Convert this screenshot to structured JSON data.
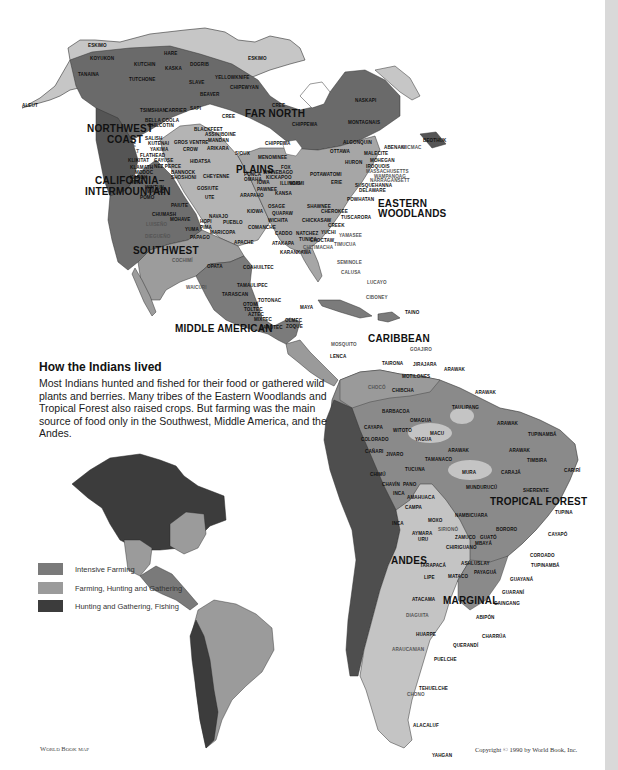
{
  "caption": {
    "title": "How the Indians lived",
    "body": "Most Indians hunted and fished for their food or gathered wild plants and berries. Many tribes of the Eastern Woodlands and Tropical Forest also raised crops. But farming was the main source of food only in the Southwest, Middle America, and the Andes."
  },
  "legend": {
    "items": [
      {
        "label": "Intensive Farming",
        "color": "#7a7a7a"
      },
      {
        "label": "Farming, Hunting and Gathering",
        "color": "#9b9b9b"
      },
      {
        "label": "Hunting and Gathering, Fishing",
        "color": "#3c3c3c"
      }
    ]
  },
  "colors": {
    "arctic": "#c6c6c6",
    "far_north": "#6a6a6a",
    "plains": "#b4b4b4",
    "woodlands": "#a6a6a6",
    "nw_coast": "#555555",
    "california": "#6e6e6e",
    "southwest": "#9c9c9c",
    "middle_america": "#7b7b7b",
    "andes": "#4e4e4e",
    "tropical": "#8a8a8a",
    "marginal": "#c4c4c4",
    "circum_caribbean": "#9a9a9a"
  },
  "regions": {
    "far_north": "FAR NORTH",
    "northwest_coast_1": "NORTHWEST",
    "northwest_coast_2": "COAST",
    "plains": "PLAINS",
    "california_1": "CALIFORNIA–",
    "california_2": "INTERMOUNTAIN",
    "eastern_1": "EASTERN",
    "eastern_2": "WOODLANDS",
    "southwest": "SOUTHWEST",
    "middle_american": "MIDDLE AMERICAN",
    "caribbean": "CARIBBEAN",
    "tropical_forest": "TROPICAL FOREST",
    "andes": "ANDES",
    "marginal": "MARGINAL"
  },
  "tribes": {
    "eskimo_w": "ESKIMO",
    "eskimo_e": "ESKIMO",
    "aleut": "ALEUT",
    "koyukon": "KOYUKON",
    "kutchin": "KUTCHIN",
    "hare": "HARE",
    "dogrib": "DOGRIB",
    "kaska": "KASKA",
    "tanaina": "TANAINA",
    "tutchone": "TUTCHONE",
    "yellowknife": "YELLOWKNIFE",
    "slave": "SLAVE",
    "chipewyan": "CHIPEWYAN",
    "beaver": "BEAVER",
    "carrier": "CARRIER",
    "tsimshian": "TSIMSHIAN",
    "sapi": "SAPI",
    "cree1": "CREE",
    "cree2": "CREE",
    "bella_coola": "BELLA COOLA",
    "chilcotin": "CHILCOTIN",
    "blackfeet": "BLACKFEET",
    "assiniboine": "ASSINIBOINE",
    "chippewa1": "CHIPPEWA",
    "chippewa2": "CHIPPEWA",
    "chippewa3": "CHIPPEWA",
    "salish": "SALISH",
    "kutenai": "KUTENAI",
    "gros_ventre": "GROS VENTRE",
    "mandan": "MANDAN",
    "quileute": "QUILEUTE",
    "quinault": "QUINAULT",
    "yakima": "YAKIMA",
    "crow": "CROW",
    "arikara": "ARIKARA",
    "sioux": "SIOUX",
    "menominee": "MENOMINEE",
    "flathead": "FLATHEAD",
    "klikitat": "KLIKITAT",
    "cayuse": "CAYUSE",
    "hidatsa": "HIDATSA",
    "nez_perce": "NEZ PERCE",
    "klamath": "KLAMATH",
    "modoc": "MODOC",
    "karok": "KAROK",
    "hupa": "HUPA",
    "bannock": "BANNOCK",
    "shoshoni": "SHOSHONI",
    "cheyenne": "CHEYENNE",
    "ponca": "PONCA",
    "omaha": "OMAHA",
    "winnebago": "WINNEBAGO",
    "fox": "FOX",
    "kickapoo": "KICKAPOO",
    "iowa": "IOWA",
    "illinois": "ILLINOIS",
    "wintun": "WINTUN",
    "washo": "WASHO",
    "gosiute": "GOSIUTE",
    "pomo": "POMO",
    "ute": "UTE",
    "arapaho": "ARAPAHO",
    "pawnee": "PAWNEE",
    "kansa": "KANSA",
    "miami": "MIAMI",
    "erie": "ERIE",
    "paiute": "PAIUTE",
    "osage": "OSAGE",
    "shawnee": "SHAWNEE",
    "kiowa": "KIOWA",
    "quapaw": "QUAPAW",
    "cherokee": "CHEROKEE",
    "chumash": "CHUMASH",
    "mohave": "MOHAVE",
    "navajo": "NAVAJO",
    "hopi": "HOPI",
    "pueblo": "PUEBLO",
    "wichita": "WICHITA",
    "chickasaw": "CHICKASAW",
    "tuscarora": "TUSCARORA",
    "luiseno": "LUISEÑO",
    "yuma": "YUMA",
    "pima": "PIMA",
    "maricopa": "MARICOPA",
    "comanche": "COMANCHE",
    "creek": "CREEK",
    "diegueno": "DIEGUEÑO",
    "papago": "PAPAGO",
    "caddo": "CADDO",
    "natchez": "NATCHEZ",
    "yuchi": "YUCHI",
    "yamasee": "YAMASEE",
    "tunica": "TUNICA",
    "apache": "APACHE",
    "atakapa": "ATAKAPA",
    "choctaw": "CHOCTAW",
    "timucua": "TIMUCUA",
    "chitimacha": "CHITIMACHA",
    "karankawa": "KARANKAWA",
    "cochimi": "COCHIMÍ",
    "seminole": "SEMINOLE",
    "calusa": "CALUSA",
    "opata": "OPATA",
    "coahuiltec": "COAHUILTEC",
    "waicuri": "WAICURI",
    "lucayo": "LUCAYO",
    "tamaulipec": "TAMAULIPEC",
    "tarascan": "TARASCAN",
    "totonac": "TOTONAC",
    "ciboney": "CIBONEY",
    "otomi": "OTOMÍ",
    "toltec": "TOLTEC",
    "aztec": "AZTEC",
    "maya": "MAYA",
    "taino": "TAINO",
    "mixtec": "MIXTEC",
    "olmec": "OLMEC",
    "zapotec": "ZAPOTEC",
    "zoque": "ZOQUE",
    "mosquito": "MOSQUITO",
    "lenca": "LENCA",
    "algonquin": "ALGONQUIN",
    "ottawa": "OTTAWA",
    "naskapi": "NASKAPI",
    "montagnais": "MONTAGNAIS",
    "beothuk": "BEOTHUK",
    "abenaki": "ABENAKI",
    "micmac": "MICMAC",
    "malecite": "MALECITE",
    "mohegan": "MOHEGAN",
    "huron": "HURON",
    "iroquois": "IROQUOIS",
    "massachusetts": "MASSACHUSETTS",
    "wampanoag": "WAMPANOAG",
    "narragansett": "NARRAGANSETT",
    "potawatomi": "POTAWATOMI",
    "susquehanna": "SUSQUEHANNA",
    "delaware": "DELAWARE",
    "powhatan": "POWHATAN",
    "arawak_n": "ARAWAK",
    "goajiro": "GOAJIRO",
    "tairona": "TAIRONA",
    "jirajara": "JIRAJARA",
    "motilones": "MOTILONES",
    "chibcha": "CHIBCHA",
    "choco": "CHOCÓ",
    "barbacoa": "BARBACOA",
    "cayapa": "CAYAPA",
    "colorado": "COLORADO",
    "canari": "CAÑARI",
    "omagua": "OMAGUA",
    "witoto": "WITOTO",
    "yagua": "YAGUA",
    "jivaro": "JIVARO",
    "taulipang": "TAULIPANG",
    "arawak1": "ARAWAK",
    "arawak2": "ARAWAK",
    "arawak3": "ARAWAK",
    "macu": "MACU",
    "tupinamba_n": "TUPINAMBÁ",
    "tamanaco": "TAMANACO",
    "timbira": "TIMBIRA",
    "cariri": "CARIRÍ",
    "tucuna": "TUCUNA",
    "mura": "MURA",
    "caraja": "CARAJÁ",
    "mundurucu": "MUNDURUCÚ",
    "sherente": "SHERENTE",
    "panoan": "PANO",
    "chimu": "CHIMÚ",
    "amahuaca": "AMAHUACA",
    "chavin": "CHAVÍN",
    "inca": "INCA",
    "campa": "CAMPA",
    "tupina": "TUPINA",
    "nambicuara": "NAMBICUARA",
    "moxo": "MOXO",
    "siriono": "SIRIONÓ",
    "bororo": "BORORO",
    "aymara": "AYMARA",
    "uru": "URU",
    "zamuco": "ZAMUCO",
    "guato": "GUATÓ",
    "cayapo": "CAYAPÓ",
    "chiriguano": "CHIRIGUANO",
    "mbaya": "MBAYÁ",
    "coroado": "COROADO",
    "tupinamba_s": "TUPINAMBÁ",
    "tarapaca": "TARAPACÁ",
    "ashluslay": "ASHLUSLAY",
    "payagua": "PAYAGUÁ",
    "lipe": "LIPE",
    "mataco": "MATACO",
    "guayana": "GUAYANÁ",
    "guarani": "GUARANÍ",
    "atacama": "ATACAMA",
    "caingang": "CAINGANG",
    "abipon": "ABIPÓN",
    "diaguita": "DIAGUITA",
    "huarpe": "HUARPE",
    "charrua": "CHARRÚA",
    "querandi": "QUERANDÍ",
    "araucanian": "ARAUCANIAN",
    "puelche": "PUELCHE",
    "tehuelche": "TEHUELCHE",
    "chono": "CHONO",
    "alacaluf": "ALACALUF",
    "yahgan": "YAHGAN"
  },
  "footer": {
    "credit_left": "World Book map",
    "copyright": "Copyright © 1990 by World Book, Inc."
  }
}
